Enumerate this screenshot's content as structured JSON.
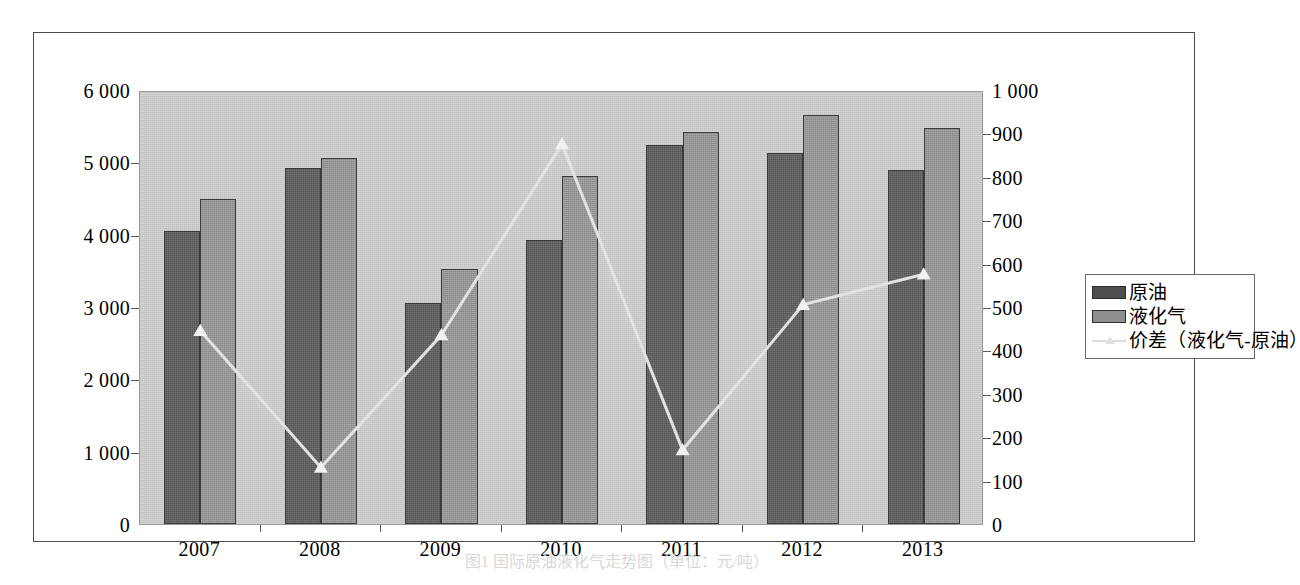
{
  "caption": "图1 国际原油液化气走势图（单位：元/吨）",
  "legend": {
    "position": "right",
    "items": [
      {
        "label": "原油",
        "type": "bar",
        "color": "#4e4e4e"
      },
      {
        "label": "液化气",
        "type": "bar",
        "color": "#8e8e8e"
      },
      {
        "label": "价差（液化气-原油）",
        "type": "line",
        "color": "#dcdcdc"
      }
    ]
  },
  "left_axis": {
    "ticks": [
      "6 000",
      "5 000",
      "4 000",
      "3 000",
      "2 000",
      "1 000",
      "0"
    ],
    "min": 0,
    "max": 6000,
    "step": 1000
  },
  "right_axis": {
    "ticks": [
      "1 000",
      "900",
      "800",
      "700",
      "600",
      "500",
      "400",
      "300",
      "200",
      "100",
      "0"
    ],
    "min": 0,
    "max": 1000,
    "step": 100
  },
  "chart_data": {
    "type": "bar",
    "title": "",
    "subtitle": "",
    "xlabel": "",
    "ylabel": "",
    "y2label": "",
    "grid": false,
    "legend_position": "right",
    "categories": [
      "2007",
      "2008",
      "2009",
      "2010",
      "2011",
      "2012",
      "2013"
    ],
    "ylim": [
      0,
      6000
    ],
    "y2lim": [
      0,
      1000
    ],
    "series": [
      {
        "name": "原油",
        "type": "bar",
        "axis": "left",
        "color": "#5e5e5e",
        "values": [
          4050,
          4920,
          3050,
          3920,
          5240,
          5130,
          4890
        ]
      },
      {
        "name": "液化气",
        "type": "bar",
        "axis": "left",
        "color": "#969696",
        "values": [
          4490,
          5060,
          3520,
          4810,
          5420,
          5650,
          5470
        ]
      },
      {
        "name": "价差（液化气-原油）",
        "type": "line",
        "axis": "right",
        "color": "#e2e2e2",
        "marker": "triangle",
        "values": [
          450,
          135,
          440,
          880,
          175,
          510,
          580
        ]
      }
    ]
  }
}
